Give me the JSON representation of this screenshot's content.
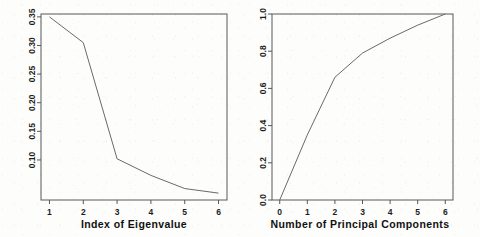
{
  "figure": {
    "background_color": "#fdfdfc",
    "line_color": "#6a6a6c",
    "axis_color": "#58585a",
    "text_color": "#1d1d1d"
  },
  "chart_data": [
    {
      "type": "line",
      "panel": "left",
      "title": "",
      "xlabel": "Index of Eigenvalue",
      "ylabel": "",
      "x": [
        1,
        2,
        3,
        4,
        5,
        6
      ],
      "values": [
        0.35,
        0.305,
        0.102,
        0.073,
        0.05,
        0.042
      ],
      "series": [
        {
          "name": "Eigenvalue proportion",
          "values": [
            0.35,
            0.305,
            0.102,
            0.073,
            0.05,
            0.042
          ]
        }
      ],
      "xlim": [
        0.75,
        6.25
      ],
      "ylim": [
        0.03,
        0.355
      ],
      "xticks": [
        1,
        2,
        3,
        4,
        5,
        6
      ],
      "xticklabels": [
        "1",
        "2",
        "3",
        "4",
        "5",
        "6"
      ],
      "yticks": [
        0.1,
        0.15,
        0.2,
        0.25,
        0.3,
        0.35
      ],
      "yticklabels": [
        "0.10",
        "0.15",
        "0.20",
        "0.25",
        "0.30",
        "0.35"
      ],
      "grid": false,
      "legend": "none"
    },
    {
      "type": "line",
      "panel": "right",
      "title": "",
      "xlabel": "Number of Principal Components",
      "ylabel": "",
      "x": [
        0,
        1,
        2,
        3,
        4,
        5,
        6
      ],
      "values": [
        0.0,
        0.35,
        0.66,
        0.79,
        0.87,
        0.94,
        1.0
      ],
      "series": [
        {
          "name": "Cumulative proportion of variance",
          "values": [
            0.0,
            0.35,
            0.66,
            0.79,
            0.87,
            0.94,
            1.0
          ]
        }
      ],
      "xlim": [
        -0.28,
        6.28
      ],
      "ylim": [
        0.0,
        1.0
      ],
      "xticks": [
        0,
        1,
        2,
        3,
        4,
        5,
        6
      ],
      "xticklabels": [
        "0",
        "1",
        "2",
        "3",
        "4",
        "5",
        "6"
      ],
      "yticks": [
        0.0,
        0.2,
        0.4,
        0.6,
        0.8,
        1.0
      ],
      "yticklabels": [
        "0.0",
        "0.2",
        "0.4",
        "0.6",
        "0.8",
        "1.0"
      ],
      "grid": false,
      "legend": "none"
    }
  ]
}
